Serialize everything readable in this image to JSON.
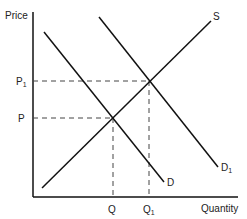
{
  "diagram": {
    "axes": {
      "y_label": "Price",
      "x_label": "Quantity"
    },
    "curves": [
      {
        "id": "D",
        "label": "D",
        "type": "demand"
      },
      {
        "id": "D1",
        "label": "D",
        "label_sub": "1",
        "type": "demand-shifted"
      },
      {
        "id": "S",
        "label": "S",
        "type": "supply"
      }
    ],
    "prices": [
      {
        "label": "P",
        "sub": ""
      },
      {
        "label": "P",
        "sub": "1"
      }
    ],
    "quantities": [
      {
        "label": "Q",
        "sub": ""
      },
      {
        "label": "Q",
        "sub": "1"
      }
    ],
    "colors": {
      "line": "#111111",
      "text": "#222222",
      "dash": "#444444"
    }
  }
}
